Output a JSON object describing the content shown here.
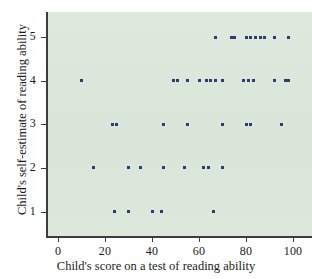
{
  "chart_data": {
    "type": "scatter",
    "title": "",
    "xlabel": "Child's score on a test of reading ability",
    "ylabel": "Child's self-estimate of reading ability",
    "xlim": [
      0,
      104
    ],
    "ylim": [
      0.3,
      5.6
    ],
    "xticks": [
      0,
      20,
      40,
      60,
      80,
      100
    ],
    "yticks": [
      1,
      2,
      3,
      4,
      5
    ],
    "xticklabels": [
      "0",
      "20",
      "40",
      "60",
      "80",
      "100"
    ],
    "yticklabels": [
      "1",
      "2",
      "3",
      "4",
      "5"
    ],
    "grid": false,
    "legend": null,
    "marker": "square",
    "marker_color": "#2c3c77",
    "panel_color": "#dde8dc",
    "points": [
      {
        "x": 10,
        "y": 4
      },
      {
        "x": 15,
        "y": 2
      },
      {
        "x": 23,
        "y": 3
      },
      {
        "x": 24,
        "y": 1
      },
      {
        "x": 25,
        "y": 3
      },
      {
        "x": 30,
        "y": 1
      },
      {
        "x": 30,
        "y": 2
      },
      {
        "x": 35,
        "y": 2
      },
      {
        "x": 40,
        "y": 1
      },
      {
        "x": 44,
        "y": 1
      },
      {
        "x": 45,
        "y": 2
      },
      {
        "x": 45,
        "y": 3
      },
      {
        "x": 49,
        "y": 4
      },
      {
        "x": 51,
        "y": 4
      },
      {
        "x": 54,
        "y": 2
      },
      {
        "x": 55,
        "y": 3
      },
      {
        "x": 55,
        "y": 4
      },
      {
        "x": 60,
        "y": 4
      },
      {
        "x": 62,
        "y": 2
      },
      {
        "x": 64,
        "y": 2
      },
      {
        "x": 63,
        "y": 4
      },
      {
        "x": 65,
        "y": 4
      },
      {
        "x": 66,
        "y": 1
      },
      {
        "x": 67,
        "y": 4
      },
      {
        "x": 67,
        "y": 5
      },
      {
        "x": 70,
        "y": 2
      },
      {
        "x": 70,
        "y": 3
      },
      {
        "x": 70,
        "y": 4
      },
      {
        "x": 74,
        "y": 5
      },
      {
        "x": 75,
        "y": 5
      },
      {
        "x": 79,
        "y": 4
      },
      {
        "x": 80,
        "y": 3
      },
      {
        "x": 80,
        "y": 5
      },
      {
        "x": 81,
        "y": 4
      },
      {
        "x": 82,
        "y": 3
      },
      {
        "x": 82,
        "y": 5
      },
      {
        "x": 83,
        "y": 4
      },
      {
        "x": 84,
        "y": 5
      },
      {
        "x": 86,
        "y": 5
      },
      {
        "x": 88,
        "y": 5
      },
      {
        "x": 92,
        "y": 4
      },
      {
        "x": 92,
        "y": 5
      },
      {
        "x": 95,
        "y": 3
      },
      {
        "x": 97,
        "y": 4
      },
      {
        "x": 98,
        "y": 4
      },
      {
        "x": 98,
        "y": 5
      }
    ]
  }
}
